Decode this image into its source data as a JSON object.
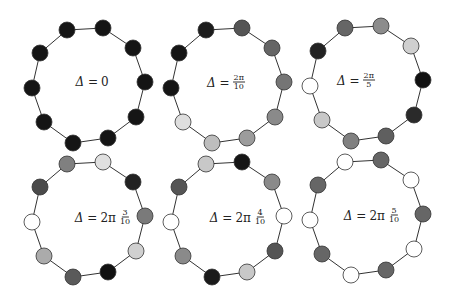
{
  "diagrams": [
    {
      "id": "d1",
      "label": {
        "prefix": "Δ = ",
        "coef": "0",
        "num": "",
        "den": ""
      },
      "label_pos": [
        92,
        82
      ],
      "offset": [
        0,
        0
      ],
      "node_colors": [
        "#151515",
        "#151515",
        "#151515",
        "#151515",
        "#151515",
        "#151515",
        "#151515",
        "#151515",
        "#151515",
        "#151515"
      ]
    },
    {
      "id": "d2",
      "label": {
        "prefix": "Δ = ",
        "coef": "",
        "num": "2π",
        "den": "10"
      },
      "label_pos": [
        226,
        82
      ],
      "offset": [
        139,
        0
      ],
      "node_colors": [
        "#1c1c1c",
        "#555555",
        "#656565",
        "#757575",
        "#8a8a8a",
        "#9c9c9c",
        "#bdbdbd",
        "#dedede",
        "#151515",
        "#151515"
      ]
    },
    {
      "id": "d3",
      "label": {
        "prefix": "Δ = ",
        "coef": "",
        "num": "2π",
        "den": "5"
      },
      "label_pos": [
        356,
        80
      ],
      "offset": [
        278,
        -2
      ],
      "node_colors": [
        "#666666",
        "#8c8c8c",
        "#cfcfcf",
        "#111111",
        "#2a2a2a",
        "#5f5f5f",
        "#808080",
        "#c8c8c8",
        "#ffffff",
        "#222222"
      ]
    },
    {
      "id": "d4",
      "label": {
        "prefix": "Δ = ",
        "coef": "2π",
        "num": "3",
        "den": "10"
      },
      "label_pos": [
        103,
        217
      ],
      "offset": [
        0,
        134
      ],
      "node_colors": [
        "#808080",
        "#e0e0e0",
        "#222222",
        "#7a7a7a",
        "#d0d0d0",
        "#111111",
        "#5a5a5a",
        "#ababab",
        "#ffffff",
        "#4a4a4a"
      ]
    },
    {
      "id": "d5",
      "label": {
        "prefix": "Δ = ",
        "coef": "2π",
        "num": "4",
        "den": "10"
      },
      "label_pos": [
        238,
        217
      ],
      "offset": [
        139,
        134
      ],
      "node_colors": [
        "#c8c8c8",
        "#151515",
        "#8a8a8a",
        "#ffffff",
        "#555555",
        "#c8c8c8",
        "#1a1a1a",
        "#8a8a8a",
        "#ffffff",
        "#555555"
      ]
    },
    {
      "id": "d6",
      "label": {
        "prefix": "Δ = ",
        "coef": "2π",
        "num": "5",
        "den": "10"
      },
      "label_pos": [
        372,
        215
      ],
      "offset": [
        278,
        132
      ],
      "node_colors": [
        "#ffffff",
        "#666666",
        "#ffffff",
        "#666666",
        "#ffffff",
        "#666666",
        "#ffffff",
        "#666666",
        "#ffffff",
        "#666666"
      ]
    }
  ],
  "base_nodes": [
    [
      67,
      30
    ],
    [
      103,
      28
    ],
    [
      133,
      48
    ],
    [
      145,
      82
    ],
    [
      136,
      117
    ],
    [
      108,
      138
    ],
    [
      73,
      143
    ],
    [
      44,
      122
    ],
    [
      32,
      88
    ],
    [
      40,
      53
    ]
  ],
  "node_radius": 8
}
